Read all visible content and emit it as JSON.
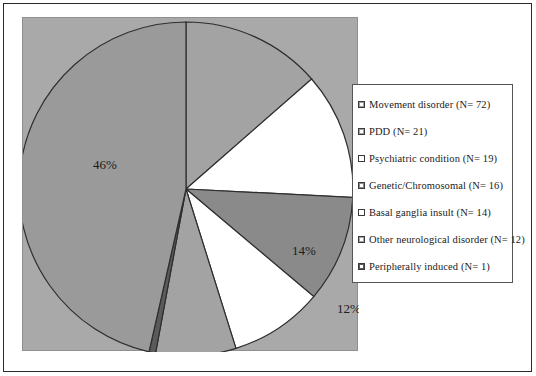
{
  "figure": {
    "background_color": "#ffffff",
    "plot_background_color": "#a9a9a9",
    "frame_color": "#2b2b2b"
  },
  "legend": {
    "position": "right",
    "border_color": "#555555",
    "background_color": "#ffffff",
    "items": [
      {
        "label": "Movement disorder (N= 72)",
        "color": "#9a9a9a",
        "swatch": "filled"
      },
      {
        "label": "PDD (N= 21)",
        "color": "#a3a3a3",
        "swatch": "filled"
      },
      {
        "label": "Psychiatric condition (N= 19)",
        "color": "#ffffff",
        "swatch": "hollow"
      },
      {
        "label": "Genetic/Chromosomal (N= 16)",
        "color": "#8a8a8a",
        "swatch": "filled"
      },
      {
        "label": "Basal ganglia insult (N= 14)",
        "color": "#ffffff",
        "swatch": "hollow"
      },
      {
        "label": "Other neurological disorder (N= 12)",
        "color": "#a3a3a3",
        "swatch": "filled"
      },
      {
        "label": "Peripherally induced (N= 1)",
        "color": "#5a5a5a",
        "swatch": "filled"
      }
    ]
  },
  "chart_data": {
    "type": "pie",
    "title": "",
    "xlabel": "",
    "ylabel": "",
    "legend_position": "right",
    "grid": false,
    "start_angle_deg": 90,
    "direction": "clockwise",
    "total_n": 155,
    "categories": [
      "Movement disorder",
      "PDD",
      "Psychiatric condition",
      "Genetic/Chromosomal",
      "Basal ganglia insult",
      "Other neurological disorder",
      "Peripherally induced"
    ],
    "counts": [
      72,
      21,
      19,
      16,
      14,
      12,
      1
    ],
    "values": [
      46,
      14,
      12,
      10,
      9,
      8,
      1
    ],
    "labels": [
      "46%",
      "14%",
      "12%",
      "10%",
      "9%",
      "8%",
      "1%"
    ],
    "slice_colors": [
      "#9a9a9a",
      "#a3a3a3",
      "#ffffff",
      "#8a8a8a",
      "#ffffff",
      "#a3a3a3",
      "#5a5a5a"
    ],
    "slices": [
      {
        "name": "PDD",
        "count": 21,
        "percent": 14,
        "label": "14%",
        "color": "#a3a3a3",
        "start_deg": 0,
        "sweep_deg": 48.8,
        "label_x": 118,
        "label_y": 66
      },
      {
        "name": "Psychiatric condition",
        "count": 19,
        "percent": 12,
        "label": "12%",
        "color": "#ffffff",
        "start_deg": 48.8,
        "sweep_deg": 44.1,
        "label_x": 163,
        "label_y": 124
      },
      {
        "name": "Genetic/Chromosomal",
        "count": 16,
        "percent": 10,
        "label": "10%",
        "color": "#8a8a8a",
        "start_deg": 92.9,
        "sweep_deg": 37.2,
        "label_x": 159,
        "label_y": 203
      },
      {
        "name": "Basal ganglia insult",
        "count": 14,
        "percent": 9,
        "label": "9%",
        "color": "#ffffff",
        "start_deg": 130.1,
        "sweep_deg": 32.5,
        "label_x": 101,
        "label_y": 248
      },
      {
        "name": "Other neurological disorder",
        "count": 12,
        "percent": 8,
        "label": "8%",
        "color": "#a3a3a3",
        "start_deg": 162.6,
        "sweep_deg": 27.9,
        "label_x": 48,
        "label_y": 278
      },
      {
        "name": "Peripherally induced",
        "count": 1,
        "percent": 1,
        "label": "1%",
        "color": "#5a5a5a",
        "start_deg": 190.5,
        "sweep_deg": 2.3,
        "label_x": 10,
        "label_y": 278
      },
      {
        "name": "Movement disorder",
        "count": 72,
        "percent": 46,
        "label": "46%",
        "color": "#9a9a9a",
        "start_deg": 192.8,
        "sweep_deg": 167.2,
        "label_x": -81,
        "label_y": -20
      }
    ]
  }
}
